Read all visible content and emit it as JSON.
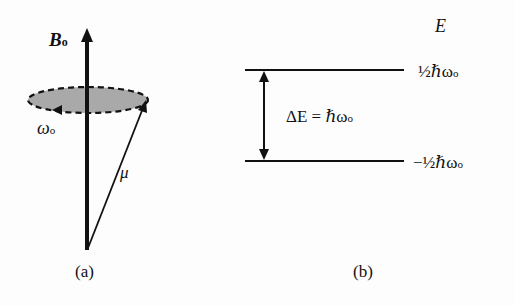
{
  "panel_a": {
    "caption": "(a)",
    "field_label": "B",
    "field_sub": "o",
    "precession_label": "ω",
    "precession_sub": "o",
    "moment_label": "μ"
  },
  "panel_b": {
    "caption": "(b)",
    "axis_label": "E",
    "upper_level": "½ℏω",
    "upper_sub": "o",
    "lower_level": "−½ℏω",
    "lower_sub": "o",
    "gap_label": "ΔE = ℏω",
    "gap_sub": "o"
  },
  "colors": {
    "ink": "#111111",
    "disc_fill": "#a9a9a9"
  }
}
